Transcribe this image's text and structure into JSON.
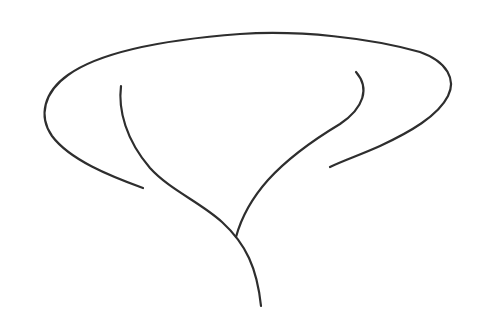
{
  "drawing": {
    "description": "Hand-drawn line sketch of a tree/mushroom-like shape",
    "background": "#ffffff",
    "stroke_color": "#2e2e2e",
    "stroke_width": 2.2,
    "strokes": [
      {
        "name": "outer-canopy-outline",
        "d": "M143,188 C110,176 70,160 52,136 C38,116 44,92 68,75 C100,52 160,40 240,34 C300,30 370,38 420,52 C448,62 456,80 448,96 C438,116 410,132 380,146 C360,155 342,161 330,167"
      },
      {
        "name": "left-inner-branch-trunk",
        "d": "M121,86 C118,110 126,140 150,168 C170,190 200,202 222,222 C246,244 257,268 261,306"
      },
      {
        "name": "right-inner-branch",
        "d": "M356,72 C370,88 364,108 340,124 C310,142 288,158 268,180 C252,198 242,215 236,237"
      }
    ]
  }
}
